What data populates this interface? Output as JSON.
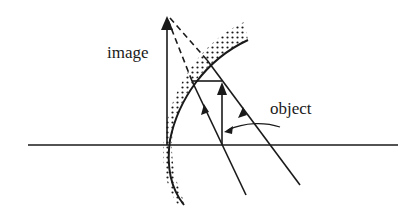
{
  "diagram": {
    "labels": {
      "image": "image",
      "object": "object"
    },
    "elements": {
      "optical_axis": "horizontal line",
      "mirror": "concave spherical mirror (stippled back)",
      "object_arrow": "upright arrow on axis",
      "image_arrow": "upright virtual image arrow",
      "rays": "two rays with arrowheads, dashed virtual extensions"
    },
    "colors": {
      "ink": "#1a1a1a",
      "background": "#ffffff"
    }
  }
}
